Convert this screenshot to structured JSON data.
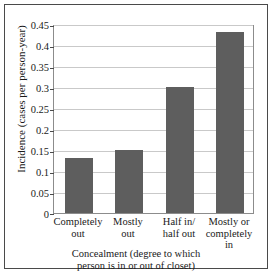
{
  "chart_data": {
    "type": "bar",
    "title": "",
    "categories": [
      "Completely\nout",
      "Mostly\nout",
      "Half in/\nhalf out",
      "Mostly or\ncompletely\nin"
    ],
    "category_lines": [
      [
        "Completely",
        "out"
      ],
      [
        "Mostly",
        "out"
      ],
      [
        "Half in/",
        "half out"
      ],
      [
        "Mostly or",
        "completely",
        "in"
      ]
    ],
    "values": [
      0.13,
      0.15,
      0.3,
      0.43
    ],
    "xlabel": "Concealment (degree to which person is in or out of closet)",
    "xlabel_lines": [
      "Concealment (degree to which",
      "person is in or out of closet)"
    ],
    "ylabel": "Incidence (cases per person-year)",
    "ylim": [
      0,
      0.45
    ],
    "yticks": [
      0,
      0.05,
      0.1,
      0.15,
      0.2,
      0.25,
      0.3,
      0.35,
      0.4,
      0.45
    ],
    "ytick_labels": [
      "0",
      "0.05",
      "0.1",
      "0.15",
      "0.2",
      "0.25",
      "0.3",
      "0.35",
      "0.4",
      "0.45"
    ],
    "grid": true,
    "legend": null,
    "colors": {
      "bar": "#5e5e5e",
      "gridline": "#c9c9c9",
      "axis": "#8c8c8c",
      "frame": "#4a4a4a",
      "text": "#1a1a1a",
      "background": "#ffffff"
    }
  }
}
